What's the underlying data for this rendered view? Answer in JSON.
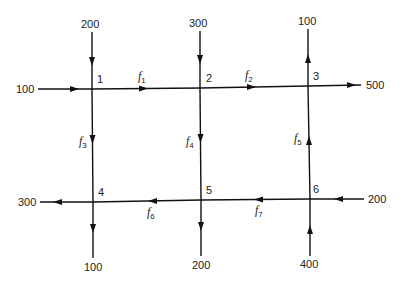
{
  "diagram": {
    "type": "traffic-flow-network",
    "nodes": [
      {
        "id": "1",
        "label": "1",
        "x": 92,
        "y": 89
      },
      {
        "id": "2",
        "label": "2",
        "x": 200,
        "y": 88
      },
      {
        "id": "3",
        "label": "3",
        "x": 308,
        "y": 86
      },
      {
        "id": "4",
        "label": "4",
        "x": 93,
        "y": 202
      },
      {
        "id": "5",
        "label": "5",
        "x": 201,
        "y": 200
      },
      {
        "id": "6",
        "label": "6",
        "x": 310,
        "y": 199
      }
    ],
    "internal_flows": [
      {
        "name": "f",
        "sub": "1",
        "from": "1",
        "to": "2"
      },
      {
        "name": "f",
        "sub": "2",
        "from": "2",
        "to": "3"
      },
      {
        "name": "f",
        "sub": "3",
        "from": "1",
        "to": "4"
      },
      {
        "name": "f",
        "sub": "4",
        "from": "2",
        "to": "5"
      },
      {
        "name": "f",
        "sub": "5",
        "from": "6",
        "to": "3"
      },
      {
        "name": "f",
        "sub": "6",
        "from": "5",
        "to": "4"
      },
      {
        "name": "f",
        "sub": "7",
        "from": "6",
        "to": "5"
      }
    ],
    "external_flows": [
      {
        "node": "1",
        "direction": "in",
        "side": "top",
        "value": "200"
      },
      {
        "node": "1",
        "direction": "in",
        "side": "left",
        "value": "100"
      },
      {
        "node": "2",
        "direction": "in",
        "side": "top",
        "value": "300"
      },
      {
        "node": "3",
        "direction": "out",
        "side": "top",
        "value": "100"
      },
      {
        "node": "3",
        "direction": "out",
        "side": "right",
        "value": "500"
      },
      {
        "node": "4",
        "direction": "out",
        "side": "left",
        "value": "300"
      },
      {
        "node": "4",
        "direction": "out",
        "side": "bottom",
        "value": "100"
      },
      {
        "node": "5",
        "direction": "out",
        "side": "bottom",
        "value": "200"
      },
      {
        "node": "6",
        "direction": "in",
        "side": "right",
        "value": "200"
      },
      {
        "node": "6",
        "direction": "in",
        "side": "bottom",
        "value": "400"
      }
    ]
  }
}
